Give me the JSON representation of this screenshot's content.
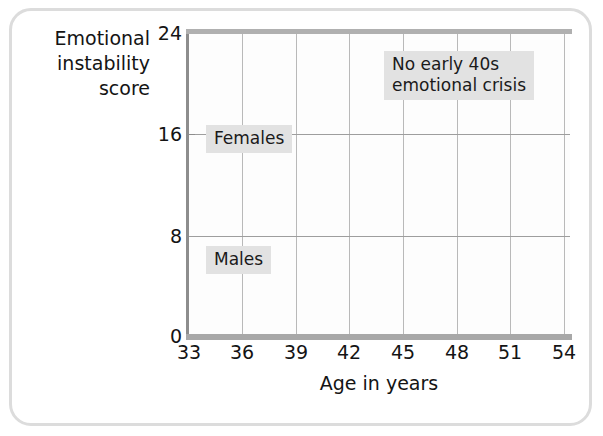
{
  "axes": {
    "ylabel": "Emotional\ninstability\nscore",
    "xlabel": "Age in years",
    "yticks": [
      "24",
      "16",
      "8",
      "0"
    ],
    "xticks": [
      "33",
      "36",
      "39",
      "42",
      "45",
      "48",
      "51",
      "54"
    ]
  },
  "labels": {
    "females": "Females",
    "males": "Males",
    "note": "No early 40s\nemotional crisis"
  },
  "colors": {
    "series_line": "#b7b7b7",
    "grid": "#b9b9b9",
    "axis": "#8d8d8d",
    "label_box": "#e2e2e2",
    "text": "#141414",
    "card_border": "#dcdcdc"
  },
  "chart_data": {
    "type": "line",
    "title": "",
    "xlabel": "Age in years",
    "ylabel": "Emotional instability score",
    "xlim": [
      33,
      54
    ],
    "ylim": [
      0,
      24
    ],
    "xticks": [
      33,
      36,
      39,
      42,
      45,
      48,
      51,
      54
    ],
    "yticks": [
      0,
      8,
      16,
      24
    ],
    "grid": "vertical gridlines at every x tick; horizontal gridlines at y = 8 and y = 16",
    "legend": "inline boxed labels 'Females' (upper line) and 'Males' (lower line)",
    "annotations": [
      {
        "text": "No early 40s emotional crisis",
        "x": 45.5,
        "y": 21.0
      }
    ],
    "x": [
      33,
      34,
      35,
      36,
      37,
      38,
      39,
      40,
      41,
      42,
      43,
      44,
      45,
      46,
      47,
      48,
      49,
      50,
      51,
      52,
      53,
      54
    ],
    "series": [
      {
        "name": "Females",
        "values": [
          12.4,
          13.1,
          12.5,
          12.2,
          12.7,
          12.7,
          12.9,
          13.2,
          13.4,
          13.1,
          13.0,
          13.3,
          13.6,
          13.4,
          13.2,
          13.3,
          13.8,
          14.0,
          13.9,
          13.4,
          13.9,
          14.3
        ]
      },
      {
        "name": "Males",
        "values": [
          10.2,
          10.7,
          10.0,
          8.1,
          9.8,
          10.6,
          10.4,
          9.7,
          9.5,
          9.9,
          8.1,
          10.4,
          10.1,
          10.6,
          10.4,
          10.3,
          10.0,
          9.3,
          10.1,
          10.4,
          11.6,
          10.2
        ]
      }
    ]
  }
}
